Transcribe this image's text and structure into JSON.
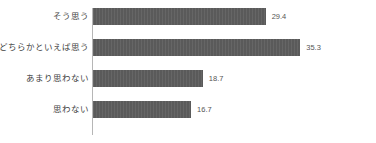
{
  "chart_data": {
    "type": "bar",
    "orientation": "horizontal",
    "title": "",
    "subtitle": "",
    "xlabel": "",
    "ylabel": "",
    "categories": [
      "そう思う",
      "どちらかといえば思う",
      "あまり思わない",
      "思わない"
    ],
    "values": [
      29.4,
      35.3,
      18.7,
      16.7
    ],
    "value_labels": [
      "29.4",
      "35.3",
      "18.7",
      "16.7"
    ],
    "series": [
      {
        "name": "",
        "values": [
          29.4,
          35.3,
          18.7,
          16.7
        ]
      }
    ],
    "xlim": [
      0,
      47
    ],
    "grid": false,
    "legend": false,
    "legend_position": "none",
    "bar_color": "#5a5a5a",
    "axis_color": "#b6b6b6",
    "background_color": "#ffffff",
    "value_label_color": "#555555",
    "category_label_color": "#3f3f3f"
  },
  "rows": [
    {
      "label": "そう思う",
      "value": 29.4,
      "value_label": "29.4"
    },
    {
      "label": "どちらかといえば思う",
      "value": 35.3,
      "value_label": "35.3"
    },
    {
      "label": "あまり思わない",
      "value": 18.7,
      "value_label": "18.7"
    },
    {
      "label": "思わない",
      "value": 16.7,
      "value_label": "16.7"
    }
  ]
}
